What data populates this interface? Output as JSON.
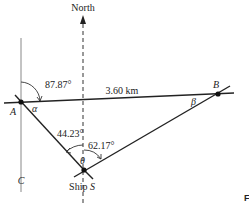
{
  "diagram": {
    "north_label": "North",
    "points": {
      "A": "A",
      "B": "B",
      "C": "C",
      "S_prefix": "Ship ",
      "S": "S"
    },
    "distance_label": "3.60 km",
    "angles": {
      "north_to_ab": "87.87°",
      "alpha": "α",
      "beta": "β",
      "theta": "θ",
      "sa_from_north": "44.23°",
      "sb_from_north": "62.17°"
    },
    "corner_fragment": "F",
    "colors": {
      "line": "#222222",
      "guide": "#888888"
    }
  }
}
